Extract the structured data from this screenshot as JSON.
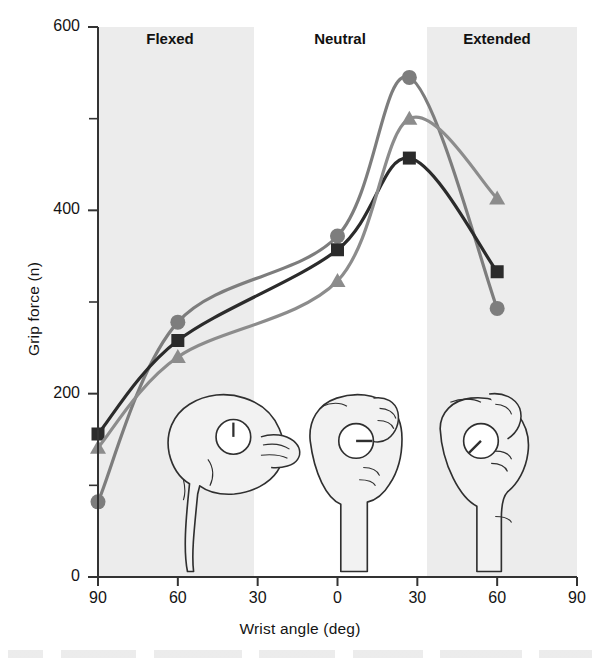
{
  "chart_data": {
    "type": "line",
    "title": "",
    "xlabel": "Wrist angle (deg)",
    "ylabel": "Grip force (n)",
    "xlim": [
      -90,
      90
    ],
    "ylim": [
      0,
      600
    ],
    "x_ticks": [
      -90,
      -60,
      -30,
      0,
      30,
      60,
      90
    ],
    "x_tick_labels": [
      "90",
      "60",
      "30",
      "0",
      "30",
      "60",
      "90"
    ],
    "y_ticks": [
      0,
      200,
      400,
      600
    ],
    "y_tick_labels": [
      "0",
      "200",
      "400",
      "600"
    ],
    "y_minor_ticks": [
      100,
      300,
      500
    ],
    "grid": false,
    "legend": "none",
    "x": [
      -90,
      -60,
      0,
      27,
      60
    ],
    "series": [
      {
        "name": "circle-series",
        "marker": "circle",
        "color": "#7d7d7d",
        "values": [
          82,
          278,
          372,
          545,
          293
        ]
      },
      {
        "name": "square-series",
        "marker": "square",
        "color": "#2b2b2b",
        "values": [
          156,
          258,
          357,
          457,
          333
        ]
      },
      {
        "name": "triangle-series",
        "marker": "triangle",
        "color": "#8c8c8c",
        "values": [
          141,
          240,
          323,
          500,
          413
        ]
      }
    ],
    "bands": [
      {
        "label": "Flexed",
        "x_start": -90,
        "x_end": -30,
        "shaded": true,
        "label_x": -60
      },
      {
        "label": "Neutral",
        "x_start": -30,
        "x_end": 30,
        "shaded": false,
        "label_x": 0
      },
      {
        "label": "Extended",
        "x_start": 30,
        "x_end": 90,
        "shaded": true,
        "label_x": 58
      }
    ],
    "annotations": [
      {
        "name": "hand-flexed",
        "description": "Hand gripping dynamometer with flexed wrist, dial needle vertical"
      },
      {
        "name": "hand-neutral",
        "description": "Hand gripping dynamometer with neutral wrist, dial needle horizontal"
      },
      {
        "name": "hand-extended",
        "description": "Hand gripping dynamometer with extended wrist, dial needle diagonal"
      }
    ],
    "colors": {
      "axis": "#333333",
      "band_shade": "#ececec",
      "plot_background": "#ffffff",
      "hand_fill": "#f2f2f2",
      "hand_stroke": "#2f2f2f"
    }
  }
}
